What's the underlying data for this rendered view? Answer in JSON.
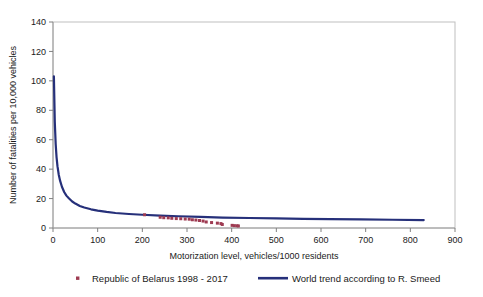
{
  "chart_data": {
    "type": "scatter",
    "title": "",
    "subtitle": "",
    "xlabel": "Motorization level, vehicles/1000 residents",
    "ylabel": "Number of fatalities per 10,000 vehicles",
    "xlim": [
      0,
      900
    ],
    "ylim": [
      0,
      140
    ],
    "xticks": [
      0,
      100,
      200,
      300,
      400,
      500,
      600,
      700,
      800,
      900
    ],
    "yticks": [
      0,
      20,
      40,
      60,
      80,
      100,
      120,
      140
    ],
    "grid": false,
    "legend_position": "bottom",
    "series": [
      {
        "name": "Republic of Belarus 1998 - 2017",
        "type": "scatter",
        "color": "#9e3b52",
        "marker": "small-square-dot",
        "points": [
          [
            205,
            9.0
          ],
          [
            240,
            7.3
          ],
          [
            248,
            7.0
          ],
          [
            258,
            6.9
          ],
          [
            266,
            6.6
          ],
          [
            276,
            6.4
          ],
          [
            286,
            6.3
          ],
          [
            296,
            6.1
          ],
          [
            305,
            6.0
          ],
          [
            312,
            5.6
          ],
          [
            320,
            5.4
          ],
          [
            328,
            5.1
          ],
          [
            336,
            4.7
          ],
          [
            343,
            4.1
          ],
          [
            355,
            3.7
          ],
          [
            368,
            3.3
          ],
          [
            376,
            3.0
          ],
          [
            379,
            2.4
          ],
          [
            401,
            1.8
          ],
          [
            406,
            1.6
          ],
          [
            412,
            1.5
          ],
          [
            415,
            1.4
          ]
        ]
      },
      {
        "name": "World trend according to R. Smeed",
        "type": "line",
        "color": "#26307a",
        "linewidth": 2.2,
        "x": [
          2,
          4,
          6,
          8,
          10,
          13,
          16,
          20,
          25,
          30,
          36,
          43,
          50,
          60,
          70,
          85,
          100,
          120,
          140,
          170,
          200,
          240,
          280,
          330,
          380,
          440,
          500,
          560,
          620,
          690,
          760,
          830
        ],
        "y": [
          103.0,
          72.0,
          57.0,
          48.0,
          42.0,
          36.0,
          32.0,
          28.0,
          24.5,
          22.0,
          20.0,
          18.0,
          16.6,
          15.0,
          13.9,
          12.7,
          11.8,
          10.9,
          10.2,
          9.5,
          9.0,
          8.4,
          8.0,
          7.5,
          7.1,
          6.8,
          6.5,
          6.2,
          6.0,
          5.8,
          5.6,
          5.4
        ]
      }
    ]
  },
  "axes": {
    "y": {
      "title": "Number of fatalities per 10,000 vehicles",
      "tick_labels": [
        "140",
        "120",
        "100",
        "80",
        "60",
        "40",
        "20",
        "0"
      ]
    },
    "x": {
      "title": "Motorization level, vehicles/1000 residents",
      "tick_labels": [
        "0",
        "100",
        "200",
        "300",
        "400",
        "500",
        "600",
        "700",
        "800",
        "900"
      ]
    }
  },
  "legend": {
    "entries": [
      {
        "label": "Republic of Belarus 1998 - 2017",
        "marker": "dot",
        "color": "#9e3b52"
      },
      {
        "label": "World trend according to R. Smeed",
        "marker": "line",
        "color": "#26307a"
      }
    ]
  },
  "colors": {
    "series_points": "#9e3b52",
    "series_line": "#26307a",
    "axis": "#808080",
    "plot_border": "#bfbfbf",
    "background": "#ffffff",
    "text": "#1a1a1a"
  }
}
